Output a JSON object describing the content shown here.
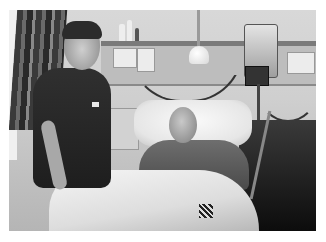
{
  "image": {
    "kind": "photograph",
    "style": "grayscale",
    "scene": "hospital room",
    "border_color": "#ffffff",
    "subjects": [
      {
        "id": "nurse",
        "description": "nurse in dark scrubs standing beside bed, smiling"
      },
      {
        "id": "patient",
        "description": "elderly patient lying in hospital bed under white blanket"
      }
    ],
    "objects": [
      "curtain",
      "wall shelf with bottles",
      "wall sockets panel",
      "examination lamp",
      "IV infusion pump on pole",
      "monitor",
      "bedside table",
      "hospital bed",
      "pillow",
      "blanket with tag"
    ]
  }
}
